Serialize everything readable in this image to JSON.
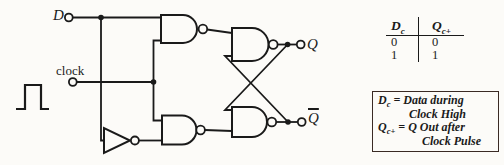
{
  "circuit": {
    "input_d": "D",
    "input_clock": "clock",
    "output_q": "Q",
    "output_qbar": "Q",
    "gate_types": [
      "NAND",
      "NAND",
      "NAND",
      "NAND",
      "NOT"
    ],
    "colors": {
      "ink": "#1a1a1a",
      "background": "#fcfbf8",
      "note_border": "#3a2a24"
    }
  },
  "truth_table": {
    "columns": [
      {
        "base": "D",
        "sub": "c"
      },
      {
        "base": "Q",
        "sub": "c+"
      }
    ],
    "rows": [
      [
        "0",
        "0"
      ],
      [
        "1",
        "1"
      ]
    ]
  },
  "note": {
    "line1": {
      "base": "D",
      "sub": "c",
      "rest": "= Data during"
    },
    "line2": "Clock High",
    "line3": {
      "base": "Q",
      "sub": "c+",
      "rest": "= Q Out after"
    },
    "line4": "Clock Pulse"
  }
}
